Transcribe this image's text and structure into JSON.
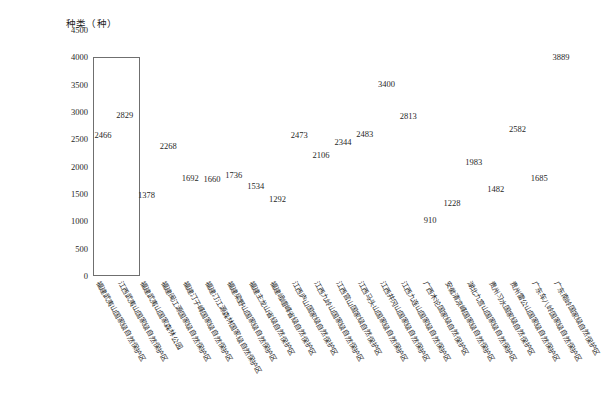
{
  "chart_data": {
    "type": "bar",
    "title": "",
    "ylabel": "种类（种）",
    "xlabel": "",
    "ylim": [
      0,
      4500
    ],
    "ytick_step": 500,
    "yticks": [
      4500,
      4000,
      3500,
      3000,
      2500,
      2000,
      1500,
      1000,
      500,
      0
    ],
    "grid": false,
    "legend": null,
    "label_rotation_deg": -60,
    "categories": [
      "福建武夷山国家级自然保护区",
      "江西武夷山国家级自然保护区",
      "福建武夷山国家森林公园",
      "福建闽江源国家级自然保护区",
      "福建汀子峰国家级自然保护区",
      "福建汀江源森林国家级自然保护区",
      "福建梁野山国家级自然保护区",
      "福建主龙山省级自然保护区",
      "福建峨嵋峰省级自然保护区",
      "江西庐山国家级自然保护区",
      "江西九岭山国家级自然保护区",
      "江西官山国家级自然保护区",
      "江西马头山国家级自然保护区",
      "江西井冈山国家级自然保护区",
      "江西九连山国家级自然保护区",
      "广西木论国家级自然保护区",
      "安徽清凉峰国家级自然保护区",
      "湖北九宫山国家级自然保护区",
      "贵州习水国家级自然保护区",
      "贵州雷公山国家级自然保护区",
      "广东车八岭国家级自然保护区",
      "广东南岭国家级自然保护区"
    ],
    "values": [
      2466,
      2829,
      1378,
      2268,
      1692,
      1660,
      1736,
      1534,
      1292,
      2473,
      2106,
      2344,
      2483,
      3400,
      2813,
      910,
      1228,
      1983,
      1482,
      2582,
      1685,
      3889
    ],
    "highlight": {
      "label": "",
      "start_index": 0,
      "end_index": 1,
      "y_top": 4000,
      "y_bottom": 0
    }
  }
}
